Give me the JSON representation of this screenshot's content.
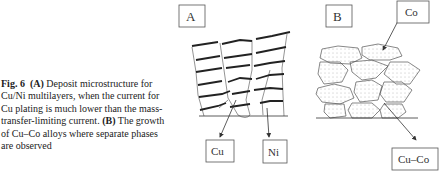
{
  "caption": {
    "fig_label": "Fig. 6",
    "part_a_label": "(A)",
    "part_a_text_1": " Deposit microstructure for Cu/Ni multilayers, when the current for Cu plating is much lower than the mass-transfer-limiting current. ",
    "part_b_label": "(B)",
    "part_b_text": " The growth of Cu–Co alloys where separate phases are observed"
  },
  "panel_a": {
    "label": "A",
    "callouts": [
      "Cu",
      "Ni"
    ]
  },
  "panel_b": {
    "label": "B",
    "callouts": [
      "Co",
      "Cu–Co"
    ]
  }
}
